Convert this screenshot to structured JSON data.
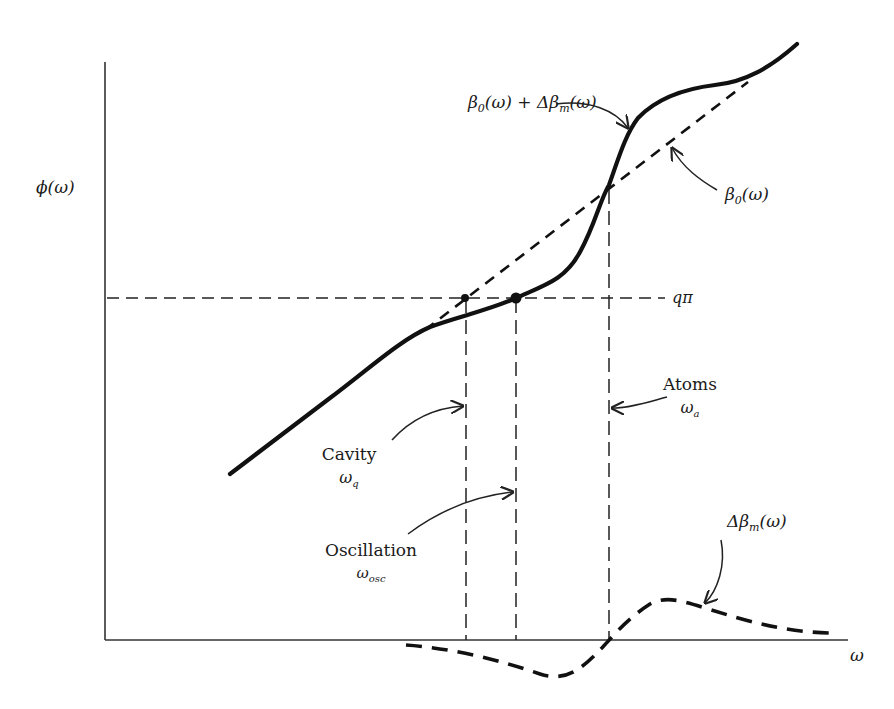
{
  "diagram": {
    "axes": {
      "y_label": "ϕ(ω)",
      "x_label": "ω"
    },
    "curves": {
      "total_label_main": "β",
      "total_label_sub": "0",
      "total_label_rest": "(ω) + Δβ",
      "total_label_sub2": "m",
      "total_label_end": "(ω)",
      "baseline_label_main": "β",
      "baseline_label_sub": "0",
      "baseline_label_end": "(ω)",
      "delta_label_main": "Δβ",
      "delta_label_sub": "m",
      "delta_label_end": "(ω)"
    },
    "reference_line": {
      "label_main": "q",
      "label_end": "π"
    },
    "markers": [
      {
        "id": "cavity",
        "title": "Cavity",
        "symbol": "ω",
        "sub": "q"
      },
      {
        "id": "oscillation",
        "title": "Oscillation",
        "symbol": "ω",
        "sub": "osc"
      },
      {
        "id": "atoms",
        "title": "Atoms",
        "symbol": "ω",
        "sub": "a"
      }
    ]
  }
}
